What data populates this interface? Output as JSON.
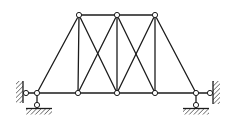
{
  "diagram": {
    "kind": "pin-jointed-truss-with-supports",
    "canvas": {
      "width": 230,
      "height": 126
    },
    "colors": {
      "background": "#ffffff",
      "line": "#1c1c1c",
      "joint_fill": "#ffffff"
    },
    "line_width": 1.3,
    "joint_radius": 2.6,
    "joint_stroke_width": 1.0,
    "nodes": {
      "T1": {
        "x": 79,
        "y": 15
      },
      "T2": {
        "x": 117,
        "y": 15
      },
      "T3": {
        "x": 155,
        "y": 15
      },
      "B0": {
        "x": 37,
        "y": 93
      },
      "B1": {
        "x": 78,
        "y": 93
      },
      "B2": {
        "x": 117,
        "y": 93
      },
      "B3": {
        "x": 155,
        "y": 93
      },
      "B4": {
        "x": 196,
        "y": 93
      },
      "WL": {
        "x": 26,
        "y": 93
      },
      "WR": {
        "x": 210,
        "y": 93
      },
      "PL": {
        "x": 37,
        "y": 105
      },
      "PR": {
        "x": 196,
        "y": 105
      }
    },
    "members": [
      [
        "B0",
        "B1"
      ],
      [
        "B1",
        "B2"
      ],
      [
        "B2",
        "B3"
      ],
      [
        "B3",
        "B4"
      ],
      [
        "T1",
        "T2"
      ],
      [
        "T2",
        "T3"
      ],
      [
        "B0",
        "T1"
      ],
      [
        "T3",
        "B4"
      ],
      [
        "T1",
        "B1"
      ],
      [
        "T2",
        "B2"
      ],
      [
        "T3",
        "B3"
      ],
      [
        "T1",
        "B2"
      ],
      [
        "T2",
        "B1"
      ],
      [
        "T2",
        "B3"
      ],
      [
        "T3",
        "B2"
      ],
      [
        "WL",
        "B0"
      ],
      [
        "B0",
        "PL"
      ],
      [
        "B4",
        "WR"
      ],
      [
        "B4",
        "PR"
      ]
    ],
    "joints": [
      "T1",
      "T2",
      "T3",
      "B0",
      "B1",
      "B2",
      "B3",
      "B4",
      "WL",
      "WR",
      "PL",
      "PR"
    ],
    "walls": [
      {
        "side": "left",
        "face_x": 23,
        "y_top": 81,
        "y_bottom": 103,
        "hatch_width": 7
      },
      {
        "side": "right",
        "face_x": 213,
        "y_top": 81,
        "y_bottom": 104,
        "hatch_width": 7
      }
    ],
    "grounds": [
      {
        "x_left": 26,
        "x_right": 52,
        "y": 108.5,
        "hatch_depth": 6
      },
      {
        "x_left": 183,
        "x_right": 209,
        "y": 108.5,
        "hatch_depth": 6
      }
    ]
  }
}
